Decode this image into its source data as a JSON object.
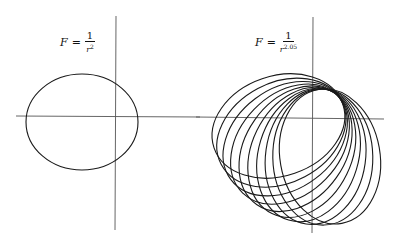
{
  "panels": [
    {
      "id": "inverse-square",
      "formula": {
        "lhs": "F",
        "eq": "=",
        "numerator": "1",
        "base": "r",
        "exponent": "2"
      },
      "orbit": {
        "type": "closed-ellipse",
        "count": 1
      }
    },
    {
      "id": "perturbed",
      "formula": {
        "lhs": "F",
        "eq": "=",
        "numerator": "1",
        "base": "r",
        "exponent": "2.05"
      },
      "orbit": {
        "type": "precessing-ellipse",
        "count": 10,
        "precession_start_deg": -19,
        "precession_step_deg": -9
      }
    }
  ],
  "colors": {
    "axis": "#555555",
    "orbit": "#1a1a1a",
    "background": "#ffffff"
  }
}
